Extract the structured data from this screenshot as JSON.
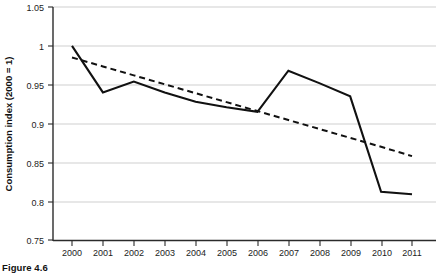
{
  "figure": {
    "caption": "Figure 4.6"
  },
  "chart_data": {
    "type": "line",
    "title": "",
    "xlabel": "",
    "ylabel": "Consumption index (2000 = 1)",
    "x": [
      2000,
      2001,
      2002,
      2003,
      2004,
      2005,
      2006,
      2007,
      2008,
      2009,
      2010,
      2011
    ],
    "xtick_labels": [
      "2000",
      "2001",
      "2002",
      "2003",
      "2004",
      "2005",
      "2006",
      "2007",
      "2008",
      "2009",
      "2010",
      "2011"
    ],
    "ytick_labels": [
      "0.75",
      "0.8",
      "0.85",
      "0.9",
      "0.95",
      "1",
      "1.05"
    ],
    "ytick_values": [
      0.75,
      0.8,
      0.85,
      0.9,
      0.95,
      1.0,
      1.05
    ],
    "ylim": [
      0.75,
      1.05
    ],
    "xlim": [
      2000,
      2011
    ],
    "grid": "horizontal",
    "legend": "none",
    "series": [
      {
        "name": "Consumption index",
        "style": "solid",
        "color": "#111111",
        "values": [
          1.0,
          0.94,
          0.954,
          0.94,
          0.928,
          0.921,
          0.915,
          0.968,
          0.952,
          0.935,
          0.812,
          0.809
        ]
      },
      {
        "name": "Trend",
        "style": "dashed",
        "color": "#111111",
        "values": [
          0.985,
          0.9735,
          0.962,
          0.9505,
          0.939,
          0.9275,
          0.916,
          0.9045,
          0.893,
          0.8815,
          0.87,
          0.858
        ]
      }
    ]
  }
}
